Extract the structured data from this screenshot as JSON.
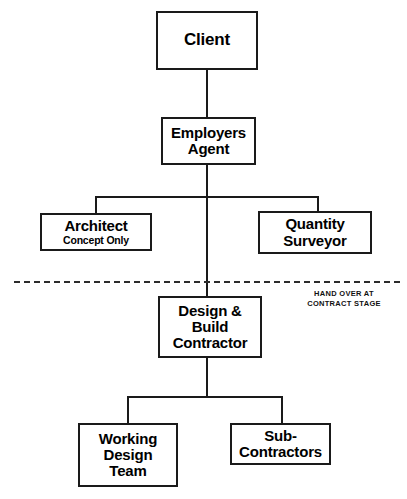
{
  "diagram": {
    "line_color": "#1a1a1a",
    "background": "#ffffff",
    "nodes": {
      "client": {
        "label": "Client"
      },
      "employers_agent": {
        "label": "Employers\nAgent"
      },
      "architect": {
        "label": "Architect",
        "subtitle": "Concept Only"
      },
      "quantity_surveyor": {
        "label": "Quantity\nSurveyor"
      },
      "design_build_contractor": {
        "label": "Design &\nBuild\nContractor"
      },
      "working_design_team": {
        "label": "Working\nDesign\nTeam"
      },
      "sub_contractors": {
        "label": "Sub-\nContractors"
      }
    },
    "annotations": {
      "handover": "HAND OVER AT\nCONTRACT STAGE"
    }
  }
}
